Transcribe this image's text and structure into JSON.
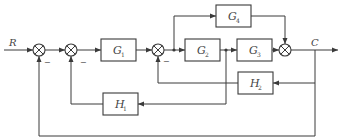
{
  "diagram": {
    "type": "control-system-block-diagram",
    "input_label": "R",
    "output_label": "C",
    "blocks": [
      {
        "id": "G1",
        "name": "G",
        "sub": "1",
        "role": "forward"
      },
      {
        "id": "G2",
        "name": "G",
        "sub": "2",
        "role": "forward"
      },
      {
        "id": "G3",
        "name": "G",
        "sub": "3",
        "role": "forward"
      },
      {
        "id": "G4",
        "name": "G",
        "sub": "4",
        "role": "feedforward"
      },
      {
        "id": "H1",
        "name": "H",
        "sub": "1",
        "role": "feedback"
      },
      {
        "id": "H2",
        "name": "H",
        "sub": "2",
        "role": "feedback"
      }
    ],
    "summing_junctions": [
      {
        "id": "S1",
        "inputs": [
          "R",
          "-C"
        ]
      },
      {
        "id": "S2",
        "inputs": [
          "S1",
          "-H1"
        ]
      },
      {
        "id": "S3",
        "inputs": [
          "G1",
          "-H2"
        ]
      },
      {
        "id": "S4",
        "inputs": [
          "G3",
          "G4"
        ]
      }
    ],
    "signs": {
      "s1": "−",
      "s2": "−",
      "s3": "−"
    },
    "connections": [
      "R -> S1",
      "S1 -> S2",
      "S2 -> G1",
      "G1 -> S3",
      "S3 -> G2",
      "S3 -> G4",
      "G2 -> G3",
      "G2 -> H1",
      "G3 -> S4",
      "G4 -> S4",
      "S4 -> C",
      "C -> H2",
      "H2 -> S3",
      "H1 -> S2",
      "C -> S1"
    ]
  }
}
